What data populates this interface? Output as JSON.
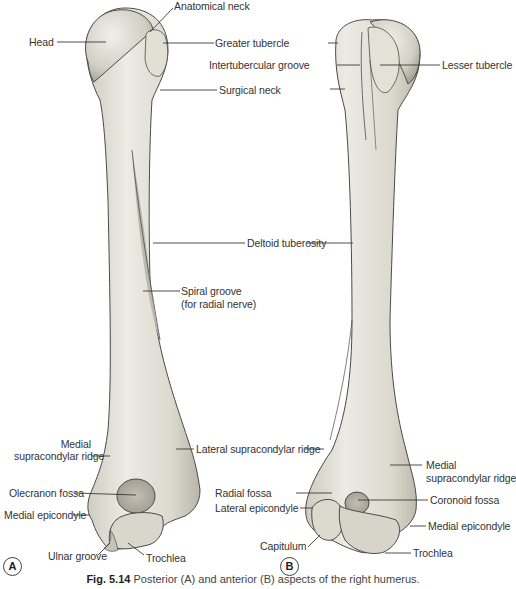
{
  "figure": {
    "caption_number": "Fig. 5.14",
    "caption_text": "Posterior (A) and anterior (B) aspects of the right humerus.",
    "colors": {
      "bone_fill": "#e6e3d8",
      "bone_shade": "#c9c5b8",
      "bone_outline": "#4a4a4a",
      "leader_line": "#3a3a3a",
      "text": "#333333"
    }
  },
  "panel_a": {
    "marker": "A",
    "view": "Posterior",
    "labels": {
      "anatomical_neck": "Anatomical neck",
      "head": "Head",
      "spiral_groove_1": "Spiral groove",
      "spiral_groove_2": "(for radial nerve)",
      "medial_supracondylar_ridge_1": "Medial",
      "medial_supracondylar_ridge_2": "supracondylar ridge",
      "olecranon_fossa": "Olecranon fossa",
      "medial_epicondyle": "Medial epicondyle",
      "ulnar_groove": "Ulnar groove",
      "trochlea": "Trochlea"
    }
  },
  "shared_labels": {
    "greater_tubercle": "Greater tubercle",
    "surgical_neck": "Surgical neck",
    "deltoid_tuberosity": "Deltoid tuberosity",
    "lateral_supracondylar_ridge": "Lateral supracondylar ridge",
    "radial_fossa": "Radial fossa",
    "lateral_epicondyle": "Lateral epicondyle"
  },
  "panel_b": {
    "marker": "B",
    "view": "Anterior",
    "labels": {
      "intertubercular_groove": "Intertubercular groove",
      "lesser_tubercle": "Lesser tubercle",
      "medial_supracondylar_ridge_1": "Medial",
      "medial_supracondylar_ridge_2": "supracondylar ridge",
      "coronoid_fossa": "Coronoid fossa",
      "medial_epicondyle": "Medial epicondyle",
      "capitulum": "Capitulum",
      "trochlea": "Trochlea"
    }
  }
}
